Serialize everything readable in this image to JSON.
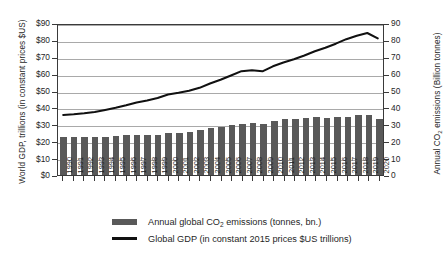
{
  "chart_data": {
    "type": "bar",
    "title": "",
    "subtitle": "",
    "xlabel": "",
    "ylabel": "World GDP, trillions (in constant prices $US)",
    "y2label": "Annual CO2 emissions (Billion tonnes)",
    "grid": true,
    "legend_position": "bottom",
    "ylim": [
      0,
      90
    ],
    "y2lim": [
      0,
      90
    ],
    "yticks": [
      "$0",
      "$10",
      "$20",
      "$30",
      "$40",
      "$50",
      "$60",
      "$70",
      "$80",
      "$90"
    ],
    "y2ticks": [
      "0",
      "10",
      "20",
      "30",
      "40",
      "50",
      "60",
      "70",
      "80",
      "90"
    ],
    "categories": [
      "1990",
      "1991",
      "1992",
      "1993",
      "1994",
      "1995",
      "1996",
      "1997",
      "1998",
      "1999",
      "2000",
      "2001",
      "2002",
      "2003",
      "2004",
      "2005",
      "2006",
      "2007",
      "2008",
      "2009",
      "2010",
      "2011",
      "2012",
      "2013",
      "2014",
      "2015",
      "2016",
      "2017",
      "2018",
      "2019",
      "2020"
    ],
    "series": [
      {
        "name": "Annual global CO2 emissions (tonnes, bn.)",
        "type": "bar",
        "axis": "right",
        "color": "#595959",
        "values": [
          22.5,
          22.6,
          22.4,
          22.5,
          22.7,
          23.1,
          23.6,
          23.8,
          23.8,
          23.8,
          24.6,
          24.9,
          25.3,
          26.4,
          27.6,
          28.6,
          29.5,
          30.3,
          30.6,
          30.3,
          32.0,
          33.0,
          33.4,
          33.9,
          34.1,
          34.0,
          34.1,
          34.6,
          35.3,
          35.4,
          33.3
        ]
      },
      {
        "name": "Global GDP (in constant 2015 prices $US trillions)",
        "type": "line",
        "axis": "left",
        "color": "#111111",
        "values": [
          36.0,
          36.4,
          37.0,
          37.8,
          39.0,
          40.3,
          41.8,
          43.5,
          44.7,
          46.2,
          48.3,
          49.3,
          50.5,
          52.3,
          54.9,
          57.1,
          59.7,
          62.3,
          62.9,
          62.2,
          65.2,
          67.5,
          69.5,
          71.7,
          74.2,
          76.4,
          78.8,
          81.5,
          83.5,
          85.2,
          82.0
        ]
      }
    ],
    "legend": [
      {
        "marker": "bar-swatch",
        "label_prefix": "Annual global CO",
        "label_sub": "2",
        "label_suffix": " emissions (tonnes, bn.)"
      },
      {
        "marker": "line-swatch",
        "label_prefix": "Global GDP (in constant 2015 prices $US trillions)",
        "label_sub": "",
        "label_suffix": ""
      }
    ],
    "axis_titles": {
      "left_text": "World GDP, trillions (in constant prices $US)",
      "right_prefix": "Annual CO",
      "right_sub": "2",
      "right_suffix": " emissions (Billion tonnes)"
    }
  }
}
